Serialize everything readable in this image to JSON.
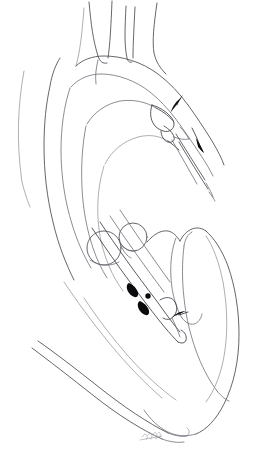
{
  "figure": {
    "kind": "line-art-medical-illustration",
    "title": "Aortic arch and left ventricle with transcatheter device in situ",
    "background_color": "#ffffff",
    "ink_color": "#4a4a52",
    "marker_color": "#0b0b0d",
    "canvas": {
      "width": 258,
      "height": 451
    },
    "visible_text": "",
    "signature": {
      "present": true,
      "legible": false,
      "label": "",
      "position": {
        "x": 150,
        "y": 436
      }
    }
  },
  "structures": [
    {
      "name": "ascending-aorta",
      "label": ""
    },
    {
      "name": "aortic-arch",
      "label": ""
    },
    {
      "name": "brachiocephalic-trunk",
      "label": ""
    },
    {
      "name": "left-common-carotid-artery",
      "label": ""
    },
    {
      "name": "left-subclavian-artery",
      "label": ""
    },
    {
      "name": "descending-thoracic-aorta",
      "label": ""
    },
    {
      "name": "aortic-root-sinus-left",
      "label": ""
    },
    {
      "name": "aortic-root-sinus-right",
      "label": ""
    },
    {
      "name": "left-ventricle-cavity",
      "label": ""
    },
    {
      "name": "left-ventricle-myocardium",
      "label": ""
    },
    {
      "name": "interventricular-septum",
      "label": ""
    },
    {
      "name": "ventricular-apex",
      "label": ""
    },
    {
      "name": "mitral-valve-leaflet",
      "label": ""
    },
    {
      "name": "chest-wall-contour",
      "label": ""
    }
  ],
  "device": {
    "name": "catheter-guidewire-assembly",
    "label": "",
    "shaft_markers": 3,
    "tip_shape": "curved-loop",
    "markers": [
      {
        "index": 1,
        "shape": "teardrop",
        "x": 133,
        "y": 289
      },
      {
        "index": 2,
        "shape": "round",
        "x": 146,
        "y": 297
      },
      {
        "index": 3,
        "shape": "teardrop",
        "x": 143,
        "y": 308
      }
    ]
  },
  "annotations": {
    "arrows": [
      {
        "name": "arrow-arch-superior",
        "direction": "up-right",
        "x": 176,
        "y": 103,
        "rotation": -52
      },
      {
        "name": "arrow-descending-aorta",
        "direction": "down-right",
        "x": 199,
        "y": 144,
        "rotation": 118
      },
      {
        "name": "arrow-ventricle-inflow",
        "direction": "down-left",
        "x": 178,
        "y": 315,
        "rotation": 205
      }
    ],
    "arrow_count": 3,
    "label_texts": []
  }
}
